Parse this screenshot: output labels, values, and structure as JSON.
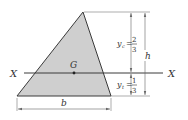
{
  "figure": {
    "colors": {
      "fill": "#cfcfcf",
      "stroke": "#3a3a3a",
      "dim": "#555555",
      "background": "#ffffff"
    },
    "labels": {
      "axis_left": "X",
      "axis_right": "X",
      "centroid": "G",
      "base": "b",
      "height": "h",
      "yc_symbol": "y",
      "yc_sub": "c",
      "yc_equals": "=",
      "yc_num": "2",
      "yc_den": "3",
      "yt_symbol": "y",
      "yt_sub": "t",
      "yt_equals": "=",
      "yt_num": "1",
      "yt_den": "3"
    }
  }
}
